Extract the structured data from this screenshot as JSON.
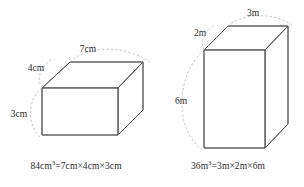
{
  "figures": [
    {
      "id": "rectangular-prism-cm",
      "labels": {
        "length": "7cm",
        "depth": "4cm",
        "height": "3cm"
      },
      "caption": {
        "volume_value": "84",
        "volume_unit": "cm",
        "volume_exponent": "3",
        "equals": "=",
        "factor_1": "7cm",
        "times_1": "×",
        "factor_2": "4cm",
        "times_2": "×",
        "factor_3": "3cm",
        "full_text": "84cm³=7cm×4cm×3cm"
      }
    },
    {
      "id": "rectangular-prism-m",
      "labels": {
        "length": "3m",
        "depth": "2m",
        "height": "6m"
      },
      "caption": {
        "volume_value": "36",
        "volume_unit": "m",
        "volume_exponent": "3",
        "equals": "=",
        "factor_1": "3m",
        "times_1": "×",
        "factor_2": "2m",
        "times_2": "×",
        "factor_3": "6m",
        "full_text": "36m³=3m×2m×6m"
      }
    }
  ],
  "colors": {
    "background": "#ffffff",
    "edge_stroke": "#555555",
    "arc_stroke": "#a9a9a9",
    "text": "#2b2b2b"
  }
}
